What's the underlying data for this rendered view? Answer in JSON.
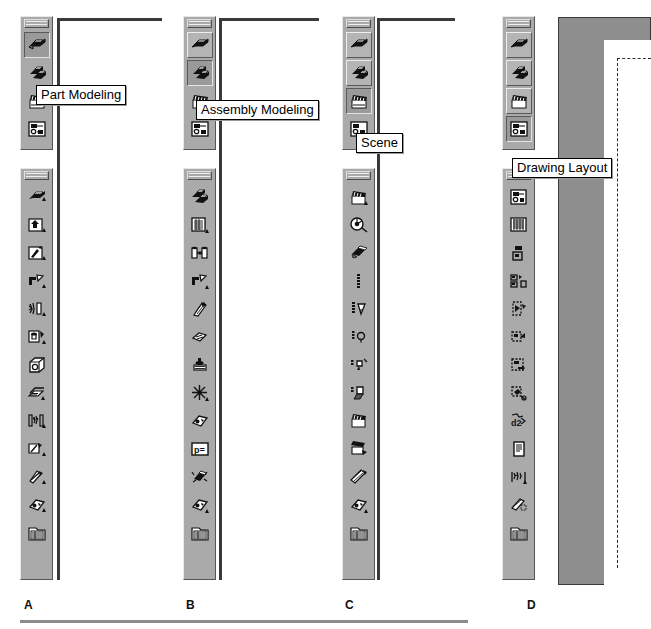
{
  "page": {
    "width": 651,
    "height": 629,
    "background": "#ffffff",
    "rule_color": "#8b8b8b"
  },
  "colors": {
    "toolbar_face": "#aaaaaa",
    "button_pressed": "#9a9a9a",
    "button_raised": "#b4b4b4",
    "highlight": "#ededed",
    "shadow": "#5a5a5a",
    "page_gray": "#8e8e8e",
    "sheet_white": "#ffffff",
    "outline": "#3a3a3a",
    "tooltip_bg": "#ffffff",
    "tooltip_border": "#000000",
    "text": "#000000"
  },
  "panels": [
    {
      "id": "A",
      "caption": "A",
      "tooltip": "Part Modeling",
      "mode_toolbar": {
        "name": "mode-toolbar",
        "active_index": 0,
        "buttons": [
          {
            "icon": "part-modeling-icon",
            "label": "Part Modeling",
            "state": "pressed"
          },
          {
            "icon": "assembly-modeling-icon",
            "label": "Assembly Modeling",
            "state": "normal"
          },
          {
            "icon": "scene-icon",
            "label": "Scene",
            "state": "normal"
          },
          {
            "icon": "drawing-layout-icon",
            "label": "Drawing Layout",
            "state": "normal"
          }
        ]
      },
      "command_toolbar": {
        "name": "part-modeling-toolbar",
        "buttons": [
          {
            "icon": "sketch-profile-icon",
            "label": "Sketch"
          },
          {
            "icon": "extrude-feature-icon",
            "label": "Extrude"
          },
          {
            "icon": "revolve-feature-icon",
            "label": "Revolve"
          },
          {
            "icon": "sweep-feature-icon",
            "label": "Sweep"
          },
          {
            "icon": "loft-feature-icon",
            "label": "Loft"
          },
          {
            "icon": "hole-feature-icon",
            "label": "Hole"
          },
          {
            "icon": "shell-feature-icon",
            "label": "Shell"
          },
          {
            "icon": "rib-feature-icon",
            "label": "Rib"
          },
          {
            "icon": "pattern-feature-icon",
            "label": "Pattern"
          },
          {
            "icon": "fillet-feature-icon",
            "label": "Fillet"
          },
          {
            "icon": "chamfer-feature-icon",
            "label": "Chamfer"
          },
          {
            "icon": "surface-feature-icon",
            "label": "Surface"
          },
          {
            "icon": "browser-list-icon",
            "label": "Browser"
          }
        ]
      }
    },
    {
      "id": "B",
      "caption": "B",
      "tooltip": "Assembly Modeling",
      "mode_toolbar": {
        "name": "mode-toolbar",
        "active_index": 1,
        "buttons": [
          {
            "icon": "part-modeling-icon",
            "label": "Part Modeling",
            "state": "normal"
          },
          {
            "icon": "assembly-modeling-icon",
            "label": "Assembly Modeling",
            "state": "pressed"
          },
          {
            "icon": "scene-icon",
            "label": "Scene",
            "state": "normal"
          },
          {
            "icon": "drawing-layout-icon",
            "label": "Drawing Layout",
            "state": "normal"
          }
        ]
      },
      "command_toolbar": {
        "name": "assembly-modeling-toolbar",
        "buttons": [
          {
            "icon": "place-component-icon",
            "label": "Place Component"
          },
          {
            "icon": "create-component-icon",
            "label": "Create Component"
          },
          {
            "icon": "assembly-constraint-icon",
            "label": "Constraint"
          },
          {
            "icon": "replace-component-icon",
            "label": "Replace Component"
          },
          {
            "icon": "assembly-pattern-icon",
            "label": "Pattern Component"
          },
          {
            "icon": "move-component-icon",
            "label": "Move Component"
          },
          {
            "icon": "weld-symbol-icon",
            "label": "Weld"
          },
          {
            "icon": "explode-assembly-icon",
            "label": "Explode"
          },
          {
            "icon": "analysis-icon",
            "label": "Analysis"
          },
          {
            "icon": "parameters-icon",
            "label": "Parameters"
          },
          {
            "icon": "simulate-motion-icon",
            "label": "Simulate"
          },
          {
            "icon": "surface-feature-icon",
            "label": "Surface"
          },
          {
            "icon": "browser-list-icon",
            "label": "Browser"
          }
        ]
      }
    },
    {
      "id": "C",
      "caption": "C",
      "tooltip": "Scene",
      "mode_toolbar": {
        "name": "mode-toolbar",
        "active_index": 2,
        "buttons": [
          {
            "icon": "part-modeling-icon",
            "label": "Part Modeling",
            "state": "normal"
          },
          {
            "icon": "assembly-modeling-icon",
            "label": "Assembly Modeling",
            "state": "normal"
          },
          {
            "icon": "scene-icon",
            "label": "Scene",
            "state": "pressed"
          },
          {
            "icon": "drawing-layout-icon",
            "label": "Drawing Layout",
            "state": "normal"
          }
        ]
      },
      "command_toolbar": {
        "name": "scene-toolbar",
        "buttons": [
          {
            "icon": "scene-icon",
            "label": "Scene"
          },
          {
            "icon": "camera-icon",
            "label": "Camera"
          },
          {
            "icon": "surface-style-icon",
            "label": "Surface Style"
          },
          {
            "icon": "lighting-icon",
            "label": "Lighting"
          },
          {
            "icon": "spot-light-icon",
            "label": "Spot Light"
          },
          {
            "icon": "point-light-icon",
            "label": "Point Light"
          },
          {
            "icon": "directional-light-icon",
            "label": "Directional Light"
          },
          {
            "icon": "shadow-icon",
            "label": "Shadow"
          },
          {
            "icon": "animate-camera-icon",
            "label": "Animate Camera"
          },
          {
            "icon": "render-scene-icon",
            "label": "Render"
          },
          {
            "icon": "animation-timeline-icon",
            "label": "Animation Timeline"
          },
          {
            "icon": "surface-feature-icon",
            "label": "Surface"
          },
          {
            "icon": "browser-list-icon",
            "label": "Browser"
          }
        ]
      }
    },
    {
      "id": "D",
      "caption": "D",
      "tooltip": "Drawing Layout",
      "mode_toolbar": {
        "name": "mode-toolbar",
        "active_index": 3,
        "buttons": [
          {
            "icon": "part-modeling-icon",
            "label": "Part Modeling",
            "state": "normal"
          },
          {
            "icon": "assembly-modeling-icon",
            "label": "Assembly Modeling",
            "state": "normal"
          },
          {
            "icon": "scene-icon",
            "label": "Scene",
            "state": "normal"
          },
          {
            "icon": "drawing-layout-icon",
            "label": "Drawing Layout",
            "state": "pressed"
          }
        ]
      },
      "command_toolbar": {
        "name": "drawing-layout-toolbar",
        "buttons": [
          {
            "icon": "drawing-layout-icon",
            "label": "Drawing Layout"
          },
          {
            "icon": "drawing-sheet-icon",
            "label": "Sheet"
          },
          {
            "icon": "base-view-icon",
            "label": "Base View"
          },
          {
            "icon": "projected-view-icon",
            "label": "Projected View"
          },
          {
            "icon": "section-view-icon",
            "label": "Section View"
          },
          {
            "icon": "detail-view-icon",
            "label": "Detail View"
          },
          {
            "icon": "broken-view-icon",
            "label": "Broken View"
          },
          {
            "icon": "dimension-icon",
            "label": "Dimension"
          },
          {
            "icon": "drawing-notes-icon",
            "label": "Notes"
          },
          {
            "icon": "balloon-icon",
            "label": "Balloon"
          },
          {
            "icon": "hatch-fill-icon",
            "label": "Hatch"
          },
          {
            "icon": "surface-feature-icon",
            "label": "Surface"
          },
          {
            "icon": "parts-list-icon",
            "label": "Parts List"
          }
        ]
      }
    }
  ]
}
